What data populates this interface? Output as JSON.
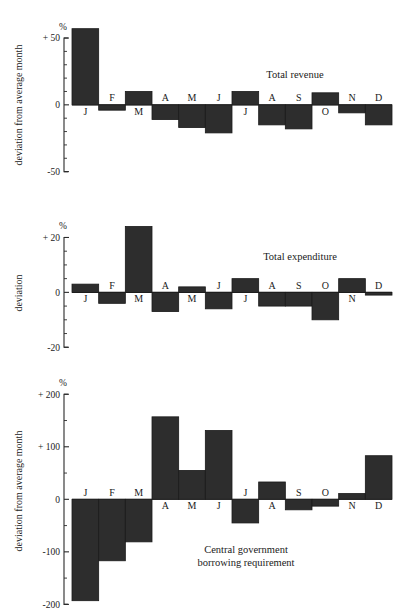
{
  "figure": {
    "background": "#ffffff",
    "bar_color": "#2d2d2d",
    "axis_color": "#2b2b2b"
  },
  "chart_data": [
    {
      "type": "bar",
      "title": "Total revenue",
      "xlabel": "",
      "ylabel": "deviation from average month",
      "unit": "%",
      "categories": [
        "J",
        "F",
        "M",
        "A",
        "M",
        "J",
        "J",
        "A",
        "S",
        "O",
        "N",
        "D"
      ],
      "values": [
        57,
        -4,
        10,
        -11,
        -17,
        -21,
        10,
        -15,
        -18,
        9,
        -6,
        -15
      ],
      "ylim": [
        -60,
        62
      ],
      "yticks": [
        50,
        0,
        -50
      ],
      "ytick_labels": [
        "+ 50",
        "0",
        "-50"
      ],
      "yminor_step": 10,
      "grid": false,
      "legend": "none"
    },
    {
      "type": "bar",
      "title": "Total expenditure",
      "xlabel": "",
      "ylabel": "deviation",
      "unit": "%",
      "categories": [
        "J",
        "F",
        "M",
        "A",
        "M",
        "J",
        "J",
        "A",
        "S",
        "O",
        "N",
        "D"
      ],
      "values": [
        3,
        -4,
        24,
        -7,
        2,
        -6,
        5,
        -5,
        -5,
        -10,
        5,
        -1
      ],
      "ylim": [
        -21,
        26
      ],
      "yticks": [
        20,
        0,
        -20
      ],
      "ytick_labels": [
        "+ 20",
        "0",
        "-20"
      ],
      "yminor_step": 5,
      "grid": false,
      "legend": "none"
    },
    {
      "type": "bar",
      "title": "Central government borrowing requirement",
      "title_lines": [
        "Central government",
        "borrowing requirement"
      ],
      "xlabel": "",
      "ylabel": "deviation from average month",
      "unit": "%",
      "categories": [
        "J",
        "F",
        "M",
        "A",
        "M",
        "J",
        "J",
        "A",
        "S",
        "O",
        "N",
        "D"
      ],
      "values": [
        -193,
        -117,
        -81,
        157,
        55,
        131,
        -45,
        33,
        -20,
        -13,
        11,
        83
      ],
      "ylim": [
        -205,
        210
      ],
      "yticks": [
        200,
        100,
        0,
        -100,
        -200
      ],
      "ytick_labels": [
        "+ 200",
        "+ 100",
        "0",
        "-100",
        "-200"
      ],
      "yminor_step": 50,
      "grid": false,
      "legend": "none"
    }
  ]
}
